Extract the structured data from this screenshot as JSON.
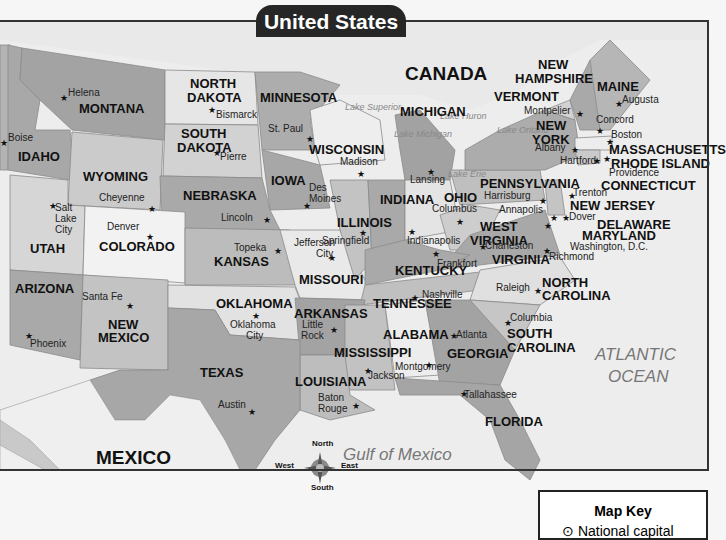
{
  "title": "United States",
  "countries": [
    {
      "name": "CANADA",
      "x": 405,
      "y": 64
    },
    {
      "name": "MEXICO",
      "x": 96,
      "y": 448
    }
  ],
  "water_bodies": [
    {
      "name": "ATLANTIC",
      "x": 595,
      "y": 346
    },
    {
      "name": "OCEAN",
      "x": 608,
      "y": 368
    },
    {
      "name": "Gulf of Mexico",
      "x": 343,
      "y": 446
    }
  ],
  "lakes": [
    {
      "name": "Lake Superior",
      "x": 345,
      "y": 103
    },
    {
      "name": "Lake Michigan",
      "x": 394,
      "y": 130
    },
    {
      "name": "Lake Huron",
      "x": 440,
      "y": 112
    },
    {
      "name": "Lake Ontario",
      "x": 497,
      "y": 126
    },
    {
      "name": "Lake Erie",
      "x": 448,
      "y": 170
    }
  ],
  "states": [
    {
      "name": "MONTANA",
      "x": 79,
      "y": 102
    },
    {
      "name": "NORTH",
      "x": 190,
      "y": 77
    },
    {
      "name": "DAKOTA",
      "x": 187,
      "y": 91
    },
    {
      "name": "MINNESOTA",
      "x": 260,
      "y": 91
    },
    {
      "name": "SOUTH",
      "x": 181,
      "y": 127
    },
    {
      "name": "DAKOTA",
      "x": 177,
      "y": 141
    },
    {
      "name": "IDAHO",
      "x": 18,
      "y": 150
    },
    {
      "name": "WISCONSIN",
      "x": 309,
      "y": 143
    },
    {
      "name": "MICHIGAN",
      "x": 400,
      "y": 105
    },
    {
      "name": "WYOMING",
      "x": 83,
      "y": 170
    },
    {
      "name": "IOWA",
      "x": 271,
      "y": 174
    },
    {
      "name": "NEBRASKA",
      "x": 183,
      "y": 189
    },
    {
      "name": "INDIANA",
      "x": 380,
      "y": 193
    },
    {
      "name": "OHIO",
      "x": 444,
      "y": 191
    },
    {
      "name": "PENNSYLVANIA",
      "x": 480,
      "y": 177
    },
    {
      "name": "ILLINOIS",
      "x": 337,
      "y": 216
    },
    {
      "name": "UTAH",
      "x": 30,
      "y": 242
    },
    {
      "name": "COLORADO",
      "x": 99,
      "y": 240
    },
    {
      "name": "KANSAS",
      "x": 214,
      "y": 255
    },
    {
      "name": "MISSOURI",
      "x": 299,
      "y": 273
    },
    {
      "name": "WEST",
      "x": 480,
      "y": 220
    },
    {
      "name": "VIRGINIA",
      "x": 470,
      "y": 234
    },
    {
      "name": "VIRGINIA",
      "x": 492,
      "y": 253
    },
    {
      "name": "KENTUCKY",
      "x": 395,
      "y": 264
    },
    {
      "name": "ARIZONA",
      "x": 15,
      "y": 282
    },
    {
      "name": "OKLAHOMA",
      "x": 216,
      "y": 297
    },
    {
      "name": "ARKANSAS",
      "x": 294,
      "y": 307
    },
    {
      "name": "TENNESSEE",
      "x": 373,
      "y": 297
    },
    {
      "name": "NORTH",
      "x": 542,
      "y": 276
    },
    {
      "name": "CAROLINA",
      "x": 542,
      "y": 289
    },
    {
      "name": "NEW",
      "x": 108,
      "y": 318
    },
    {
      "name": "MEXICO",
      "x": 98,
      "y": 331
    },
    {
      "name": "MISSISSIPPI",
      "x": 334,
      "y": 346
    },
    {
      "name": "ALABAMA",
      "x": 383,
      "y": 328
    },
    {
      "name": "SOUTH",
      "x": 507,
      "y": 327
    },
    {
      "name": "CAROLINA",
      "x": 507,
      "y": 341
    },
    {
      "name": "GEORGIA",
      "x": 447,
      "y": 347
    },
    {
      "name": "TEXAS",
      "x": 200,
      "y": 366
    },
    {
      "name": "LOUISIANA",
      "x": 295,
      "y": 375
    },
    {
      "name": "FLORIDA",
      "x": 485,
      "y": 415
    },
    {
      "name": "NEW",
      "x": 538,
      "y": 58
    },
    {
      "name": "HAMPSHIRE",
      "x": 515,
      "y": 72
    },
    {
      "name": "VERMONT",
      "x": 494,
      "y": 90
    },
    {
      "name": "MAINE",
      "x": 597,
      "y": 80
    },
    {
      "name": "NEW",
      "x": 536,
      "y": 119
    },
    {
      "name": "YORK",
      "x": 532,
      "y": 133
    },
    {
      "name": "MASSACHUSETTS",
      "x": 609,
      "y": 143
    },
    {
      "name": "RHODE ISLAND",
      "x": 611,
      "y": 157
    },
    {
      "name": "CONNECTICUT",
      "x": 601,
      "y": 179
    },
    {
      "name": "NEW JERSEY",
      "x": 570,
      "y": 199
    },
    {
      "name": "DELAWARE",
      "x": 597,
      "y": 218
    },
    {
      "name": "MARYLAND",
      "x": 582,
      "y": 229
    }
  ],
  "capitals": [
    {
      "name": "Helena",
      "x": 68,
      "y": 88,
      "star_x": 60,
      "star_y": 94
    },
    {
      "name": "Bismarck",
      "x": 216,
      "y": 110,
      "star_x": 208,
      "star_y": 106
    },
    {
      "name": "St. Paul",
      "x": 268,
      "y": 124,
      "star_x": 306,
      "star_y": 135
    },
    {
      "name": "Pierre",
      "x": 220,
      "y": 152,
      "star_x": 213,
      "star_y": 149
    },
    {
      "name": "Boise",
      "x": 8,
      "y": 133,
      "star_x": 0,
      "star_y": 139
    },
    {
      "name": "Madison",
      "x": 340,
      "y": 157,
      "star_x": 357,
      "star_y": 170
    },
    {
      "name": "Lansing",
      "x": 410,
      "y": 175,
      "star_x": 427,
      "star_y": 168
    },
    {
      "name": "Montpelier",
      "x": 524,
      "y": 106,
      "star_x": 576,
      "star_y": 110
    },
    {
      "name": "Augusta",
      "x": 622,
      "y": 95,
      "star_x": 615,
      "star_y": 100
    },
    {
      "name": "Concord",
      "x": 596,
      "y": 115,
      "star_x": 596,
      "star_y": 127
    },
    {
      "name": "Boston",
      "x": 611,
      "y": 130,
      "star_x": 606,
      "star_y": 138
    },
    {
      "name": "Albany",
      "x": 535,
      "y": 143,
      "star_x": 571,
      "star_y": 146
    },
    {
      "name": "Hartford",
      "x": 560,
      "y": 156,
      "star_x": 593,
      "star_y": 157
    },
    {
      "name": "Providence",
      "x": 609,
      "y": 168,
      "star_x": 603,
      "star_y": 155
    },
    {
      "name": "Des",
      "x": 309,
      "y": 183,
      "star_x": 303,
      "star_y": 202
    },
    {
      "name": "Moines",
      "x": 309,
      "y": 194,
      "star_x": null,
      "star_y": null
    },
    {
      "name": "Cheyenne",
      "x": 99,
      "y": 193,
      "star_x": 148,
      "star_y": 205
    },
    {
      "name": "Salt",
      "x": 55,
      "y": 203,
      "star_x": 49,
      "star_y": 202
    },
    {
      "name": "Lake",
      "x": 55,
      "y": 214,
      "star_x": null,
      "star_y": null
    },
    {
      "name": "City",
      "x": 55,
      "y": 225,
      "star_x": null,
      "star_y": null
    },
    {
      "name": "Denver",
      "x": 107,
      "y": 222,
      "star_x": 146,
      "star_y": 233
    },
    {
      "name": "Lincoln",
      "x": 221,
      "y": 213,
      "star_x": 263,
      "star_y": 216
    },
    {
      "name": "Columbus",
      "x": 432,
      "y": 204,
      "star_x": 456,
      "star_y": 218
    },
    {
      "name": "Harrisburg",
      "x": 484,
      "y": 191,
      "star_x": 539,
      "star_y": 197
    },
    {
      "name": "Trenton",
      "x": 573,
      "y": 188,
      "star_x": 568,
      "star_y": 192
    },
    {
      "name": "Annapolis",
      "x": 499,
      "y": 205,
      "star_x": 550,
      "star_y": 214
    },
    {
      "name": "Dover",
      "x": 569,
      "y": 212,
      "star_x": 562,
      "star_y": 214
    },
    {
      "name": "Springfield",
      "x": 322,
      "y": 236,
      "star_x": 359,
      "star_y": 229
    },
    {
      "name": "Indianapolis",
      "x": 407,
      "y": 236,
      "star_x": 408,
      "star_y": 228
    },
    {
      "name": "Charleston",
      "x": 485,
      "y": 241,
      "star_x": 479,
      "star_y": 243
    },
    {
      "name": "Washington, D.C.",
      "x": 570,
      "y": 242,
      "star_x": 544,
      "star_y": 222
    },
    {
      "name": "Richmond",
      "x": 549,
      "y": 252,
      "star_x": 543,
      "star_y": 247
    },
    {
      "name": "Topeka",
      "x": 234,
      "y": 243,
      "star_x": 274,
      "star_y": 247
    },
    {
      "name": "Jefferson",
      "x": 294,
      "y": 238,
      "star_x": null,
      "star_y": null
    },
    {
      "name": "City",
      "x": 316,
      "y": 249,
      "star_x": 328,
      "star_y": 254
    },
    {
      "name": "Frankfort",
      "x": 437,
      "y": 259,
      "star_x": 432,
      "star_y": 250
    },
    {
      "name": "Santa Fe",
      "x": 82,
      "y": 292,
      "star_x": 126,
      "star_y": 302
    },
    {
      "name": "Nashville",
      "x": 422,
      "y": 290,
      "star_x": 411,
      "star_y": 294
    },
    {
      "name": "Raleigh",
      "x": 496,
      "y": 283,
      "star_x": 534,
      "star_y": 287
    },
    {
      "name": "Oklahoma",
      "x": 230,
      "y": 320,
      "star_x": 252,
      "star_y": 312
    },
    {
      "name": "City",
      "x": 246,
      "y": 331,
      "star_x": null,
      "star_y": null
    },
    {
      "name": "Little",
      "x": 302,
      "y": 320,
      "star_x": 330,
      "star_y": 326
    },
    {
      "name": "Rock",
      "x": 301,
      "y": 331,
      "star_x": null,
      "star_y": null
    },
    {
      "name": "Columbia",
      "x": 510,
      "y": 313,
      "star_x": 504,
      "star_y": 319
    },
    {
      "name": "Atlanta",
      "x": 456,
      "y": 330,
      "star_x": 450,
      "star_y": 332
    },
    {
      "name": "Phoenix",
      "x": 30,
      "y": 339,
      "star_x": 25,
      "star_y": 332
    },
    {
      "name": "Montgomery",
      "x": 395,
      "y": 362,
      "star_x": 425,
      "star_y": 361
    },
    {
      "name": "Jackson",
      "x": 368,
      "y": 371,
      "star_x": 364,
      "star_y": 367
    },
    {
      "name": "Baton",
      "x": 318,
      "y": 393,
      "star_x": 352,
      "star_y": 402
    },
    {
      "name": "Rouge",
      "x": 318,
      "y": 404,
      "star_x": null,
      "star_y": null
    },
    {
      "name": "Tallahassee",
      "x": 464,
      "y": 390,
      "star_x": 460,
      "star_y": 390
    },
    {
      "name": "Austin",
      "x": 218,
      "y": 400,
      "star_x": 248,
      "star_y": 408
    }
  ],
  "compass": {
    "north": "North",
    "south": "South",
    "east": "East",
    "west": "West"
  },
  "map_key": {
    "title": "Map Key",
    "item": "National capital"
  },
  "colors": {
    "title_bg": "#262626",
    "land_dark": "#a6a6a6",
    "land_mid": "#bdbdbd",
    "land_light": "#d6d6d6",
    "land_white": "#ececec",
    "outside": "#e8e8e8",
    "water": "#efefef"
  }
}
